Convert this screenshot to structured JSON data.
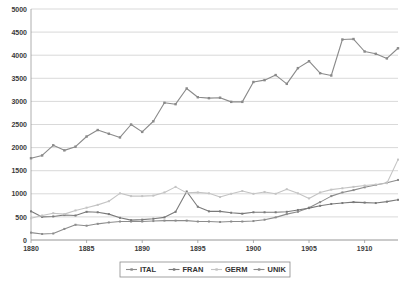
{
  "chart_data": {
    "type": "line",
    "title": "",
    "subtitle": "",
    "xlabel": "",
    "ylabel": "",
    "xlim": [
      1880,
      1913
    ],
    "ylim": [
      0,
      5000
    ],
    "grid": true,
    "legend_position": "bottom",
    "y_ticks": [
      "0",
      "500",
      "1000",
      "1500",
      "2000",
      "2500",
      "3000",
      "3500",
      "4000",
      "4500",
      "5000"
    ],
    "y_tick_values": [
      0,
      500,
      1000,
      1500,
      2000,
      2500,
      3000,
      3500,
      4000,
      4500,
      5000
    ],
    "x_ticks": [
      "1880",
      "1885",
      "1890",
      "1895",
      "1900",
      "1905",
      "1910"
    ],
    "x_tick_values": [
      1880,
      1885,
      1890,
      1895,
      1900,
      1905,
      1910
    ],
    "x": [
      1880,
      1881,
      1882,
      1883,
      1884,
      1885,
      1886,
      1887,
      1888,
      1889,
      1890,
      1891,
      1892,
      1893,
      1894,
      1895,
      1896,
      1897,
      1898,
      1899,
      1900,
      1901,
      1902,
      1903,
      1904,
      1905,
      1906,
      1907,
      1908,
      1909,
      1910,
      1911,
      1912,
      1913
    ],
    "series": [
      {
        "name": "ITAL",
        "color": "#8c8c8c",
        "marker": "line-dot",
        "values": [
          160,
          130,
          140,
          240,
          330,
          310,
          350,
          380,
          400,
          400,
          400,
          410,
          420,
          420,
          420,
          400,
          400,
          390,
          400,
          400,
          410,
          440,
          490,
          560,
          610,
          700,
          820,
          950,
          1030,
          1080,
          1140,
          1190,
          1240,
          1300
        ]
      },
      {
        "name": "FRAN",
        "color": "#7a7a7a",
        "marker": "line-dot",
        "values": [
          620,
          500,
          510,
          540,
          530,
          610,
          600,
          560,
          480,
          430,
          440,
          460,
          490,
          610,
          1050,
          720,
          620,
          620,
          590,
          570,
          600,
          600,
          600,
          610,
          650,
          690,
          740,
          780,
          800,
          820,
          810,
          800,
          830,
          870
        ]
      },
      {
        "name": "GERM",
        "color": "#c4c4c4",
        "marker": "line-dot",
        "values": [
          470,
          530,
          580,
          560,
          640,
          700,
          760,
          840,
          1010,
          950,
          950,
          960,
          1030,
          1150,
          1020,
          1030,
          1010,
          930,
          1000,
          1060,
          1000,
          1040,
          1000,
          1100,
          1010,
          900,
          1030,
          1090,
          1120,
          1150,
          1180,
          1200,
          1230,
          1740
        ]
      },
      {
        "name": "UNIK",
        "color": "#8a8a8a",
        "marker": "square",
        "values": [
          1770,
          1830,
          2050,
          1940,
          2020,
          2240,
          2380,
          2300,
          2220,
          2500,
          2340,
          2570,
          2970,
          2940,
          3280,
          3090,
          3070,
          3080,
          2990,
          2990,
          3420,
          3460,
          3570,
          3380,
          3720,
          3870,
          3610,
          3560,
          4340,
          4350,
          4080,
          4030,
          3930,
          4150
        ]
      }
    ],
    "legend": [
      "ITAL",
      "FRAN",
      "GERM",
      "UNIK"
    ]
  }
}
